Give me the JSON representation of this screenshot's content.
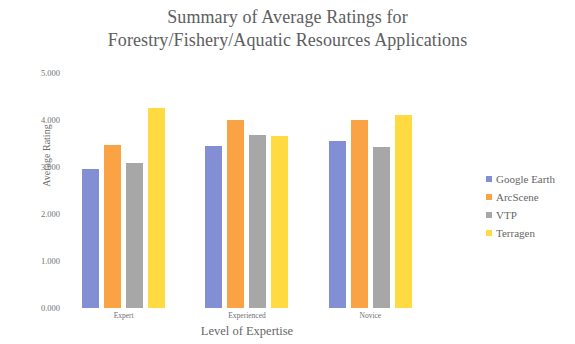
{
  "chart_data": {
    "type": "bar",
    "title": "Summary of Average Ratings for Forestry/Fishery/Aquatic Resources Applications",
    "title_lines": [
      "Summary of Average Ratings for",
      "Forestry/Fishery/Aquatic Resources Applications"
    ],
    "xlabel": "Level of Expertise",
    "ylabel": "Average Rating",
    "categories": [
      "Expert",
      "Experienced",
      "Novice"
    ],
    "ylim": [
      0,
      5
    ],
    "ytick_labels": [
      "0.000",
      "1.000",
      "2.000",
      "3.000",
      "4.000",
      "5.000"
    ],
    "ytick_values": [
      0,
      1,
      2,
      3,
      4,
      5
    ],
    "grid": false,
    "legend_position": "right",
    "series": [
      {
        "name": "Google Earth",
        "color": "#7f8cd4",
        "values": [
          2.96,
          3.44,
          3.55
        ]
      },
      {
        "name": "ArcScene",
        "color": "#f9a03f",
        "values": [
          3.46,
          4.0,
          4.01
        ]
      },
      {
        "name": "VTP",
        "color": "#a5a5a5",
        "values": [
          3.08,
          3.68,
          3.43
        ]
      },
      {
        "name": "Terragen",
        "color": "#ffd93b",
        "values": [
          4.25,
          3.67,
          4.1
        ]
      }
    ]
  },
  "legend": {
    "entries": [
      {
        "label": "Google Earth",
        "color": "#7f8cd4"
      },
      {
        "label": "ArcScene",
        "color": "#f9a03f"
      },
      {
        "label": "VTP",
        "color": "#a5a5a5"
      },
      {
        "label": "Terragen",
        "color": "#ffd93b"
      }
    ]
  }
}
